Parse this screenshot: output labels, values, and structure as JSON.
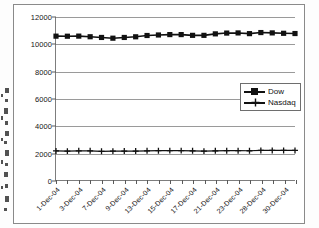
{
  "chart_data": {
    "type": "line",
    "title": "",
    "subtitle": "",
    "xlabel": "",
    "ylabel": "",
    "ylim": [
      0,
      12000
    ],
    "ytick_labels": [
      "0",
      "2000",
      "4000",
      "6000",
      "8000",
      "10000",
      "12000"
    ],
    "ytick_values": [
      0,
      2000,
      4000,
      6000,
      8000,
      10000,
      12000
    ],
    "grid": true,
    "legend_position": "right-middle",
    "categories": [
      "1-Dec-04",
      "2-Dec-04",
      "3-Dec-04",
      "6-Dec-04",
      "7-Dec-04",
      "8-Dec-04",
      "9-Dec-04",
      "10-Dec-04",
      "13-Dec-04",
      "14-Dec-04",
      "15-Dec-04",
      "16-Dec-04",
      "17-Dec-04",
      "20-Dec-04",
      "21-Dec-04",
      "22-Dec-04",
      "23-Dec-04",
      "27-Dec-04",
      "28-Dec-04",
      "29-Dec-04",
      "30-Dec-04",
      "31-Dec-04"
    ],
    "xtick_labels": [
      "1-Dec-04",
      "3-Dec-04",
      "7-Dec-04",
      "9-Dec-04",
      "13-Dec-04",
      "15-Dec-04",
      "17-Dec-04",
      "21-Dec-04",
      "23-Dec-04",
      "28-Dec-04",
      "30-Dec-04"
    ],
    "xtick_label_indices": [
      0,
      2,
      4,
      6,
      8,
      10,
      12,
      14,
      16,
      18,
      20
    ],
    "series": [
      {
        "name": "Dow",
        "marker": "square",
        "color": "#111111",
        "values": [
          10590,
          10585,
          10592,
          10547,
          10494,
          10440,
          10494,
          10543,
          10638,
          10676,
          10705,
          10705,
          10650,
          10649,
          10759,
          10816,
          10827,
          10776,
          10855,
          10829,
          10800,
          10783
        ]
      },
      {
        "name": "Nasdaq",
        "marker": "cross",
        "color": "#111111",
        "values": [
          2138,
          2126,
          2148,
          2151,
          2114,
          2126,
          2129,
          2128,
          2148,
          2159,
          2162,
          2162,
          2146,
          2127,
          2150,
          2157,
          2161,
          2154,
          2177,
          2177,
          2178,
          2175
        ]
      }
    ]
  },
  "legend": {
    "items": [
      {
        "label": "Dow",
        "marker": "square"
      },
      {
        "label": "Nasdaq",
        "marker": "cross"
      }
    ]
  }
}
